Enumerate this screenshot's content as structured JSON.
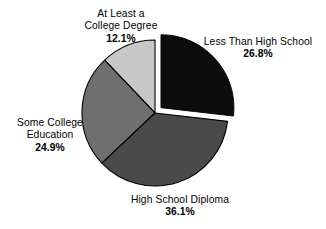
{
  "chart_data": {
    "type": "pie",
    "title": "",
    "subtitle": "",
    "xlabel": "",
    "ylabel": "",
    "legend_position": "none",
    "grid": false,
    "total_percent": "99.9",
    "start_angle_deg": 0,
    "direction": "clockwise",
    "categories": [
      "Less Than High School",
      "High School Diploma",
      "Some College Education",
      "At Least a College Degree"
    ],
    "values": [
      26.8,
      36.1,
      24.9,
      12.1
    ],
    "value_labels": [
      "26.8%",
      "36.1%",
      "24.9%",
      "12.1%"
    ],
    "colors": [
      "#0d0d0d",
      "#4a4a4a",
      "#6f6f6f",
      "#c8c8c8"
    ],
    "exploded": [
      true,
      false,
      false,
      false
    ],
    "slices": [
      {
        "name": "Less Than High School",
        "value": 26.8,
        "value_label": "26.8%",
        "color": "#0d0d0d",
        "exploded": true,
        "label_lines": [
          "Less Than High School"
        ]
      },
      {
        "name": "High School Diploma",
        "value": 36.1,
        "value_label": "36.1%",
        "color": "#4a4a4a",
        "exploded": false,
        "label_lines": [
          "High School Diploma"
        ]
      },
      {
        "name": "Some College Education",
        "value": 24.9,
        "value_label": "24.9%",
        "color": "#6f6f6f",
        "exploded": false,
        "label_lines": [
          "Some College",
          "Education"
        ]
      },
      {
        "name": "At Least a College Degree",
        "value": 12.1,
        "value_label": "12.1%",
        "color": "#c8c8c8",
        "exploded": false,
        "label_lines": [
          "At Least a",
          "College Degree"
        ]
      }
    ]
  },
  "labels": {
    "college_degree": {
      "line1": "At Least a",
      "line2": "College Degree",
      "pct": "12.1%"
    },
    "less_than_hs": {
      "line1": "Less Than High School",
      "pct": "26.8%"
    },
    "some_college": {
      "line1": "Some College",
      "line2": "Education",
      "pct": "24.9%"
    },
    "hs_diploma": {
      "line1": "High School Diploma",
      "pct": "36.1%"
    }
  },
  "colors": {
    "less_than_hs": "#0d0d0d",
    "hs_diploma": "#4a4a4a",
    "some_college": "#6f6f6f",
    "college_degree": "#c8c8c8",
    "background": "#ffffff",
    "text": "#000000",
    "outline": "#000000"
  }
}
